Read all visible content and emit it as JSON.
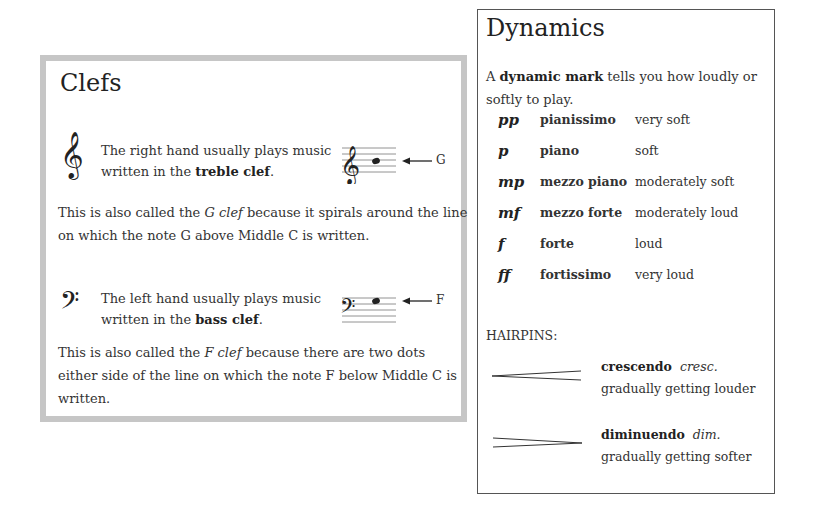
{
  "clefs": {
    "title": "Clefs",
    "treble": {
      "icon": "treble-clef-icon",
      "glyph": "𝄞",
      "desc_prefix": "The right hand usually plays music written in the ",
      "desc_bold": "treble clef",
      "desc_suffix": ".",
      "note_label": "G",
      "para_prefix": "This is also called the ",
      "para_italic": "G clef",
      "para_suffix": " because it spirals around the line on which the note G above Middle C is written."
    },
    "bass": {
      "icon": "bass-clef-icon",
      "glyph": "𝄢",
      "desc_prefix": "The left hand usually plays music written in the ",
      "desc_bold": "bass clef",
      "desc_suffix": ".",
      "note_label": "F",
      "para_prefix": "This is also called the ",
      "para_italic": "F clef",
      "para_suffix": " because there are two dots either side of the line on which the note F below Middle C is written."
    }
  },
  "dynamics": {
    "title": "Dynamics",
    "intro_prefix": "A ",
    "intro_bold": "dynamic mark",
    "intro_suffix": " tells you how loudly or softly to play.",
    "rows": [
      {
        "symbol": "pp",
        "name": "pianissimo",
        "meaning": "very soft"
      },
      {
        "symbol": "p",
        "name": "piano",
        "meaning": "soft"
      },
      {
        "symbol": "mp",
        "name": "mezzo piano",
        "meaning": "moderately soft"
      },
      {
        "symbol": "mf",
        "name": "mezzo forte",
        "meaning": "moderately loud"
      },
      {
        "symbol": "f",
        "name": "forte",
        "meaning": "loud"
      },
      {
        "symbol": "ff",
        "name": "fortissimo",
        "meaning": "very loud"
      }
    ],
    "hairpins_label": "HAIRPINS:",
    "hairpins": [
      {
        "icon": "crescendo-hairpin-icon",
        "name": "crescendo",
        "abbr": "cresc.",
        "meaning": "gradually getting louder"
      },
      {
        "icon": "diminuendo-hairpin-icon",
        "name": "diminuendo",
        "abbr": "dim.",
        "meaning": "gradually getting softer"
      }
    ]
  }
}
